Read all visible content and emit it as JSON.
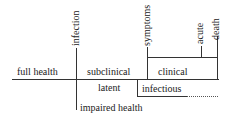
{
  "diagram": {
    "type": "disease-progression-timeline",
    "events": {
      "infection": "infection",
      "symptoms": "symptoms",
      "acute": "acute",
      "death": "death"
    },
    "phases_above": {
      "full_health": "full health",
      "subclinical": "subclinical",
      "clinical": "clinical"
    },
    "phases_below": {
      "latent": "latent",
      "infectious": "infectious",
      "impaired_health": "impaired health"
    },
    "line_color": "#333333"
  }
}
